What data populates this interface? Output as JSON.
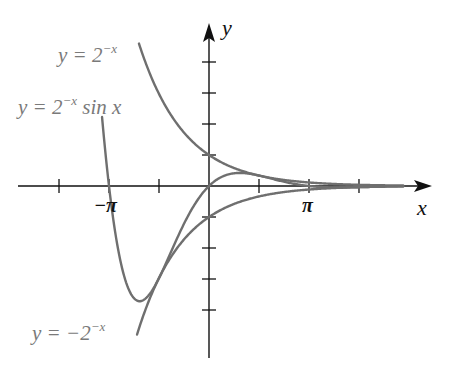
{
  "chart_data": {
    "type": "line",
    "title": "",
    "xlabel": "x",
    "ylabel": "y",
    "x_tick_labels": [
      "-π",
      "π"
    ],
    "x_ticks": [
      -4.712,
      -3.1416,
      -1.5708,
      1.5708,
      3.1416,
      4.712
    ],
    "y_ticks": [
      -4,
      -3,
      -2,
      -1,
      1,
      2,
      3,
      4
    ],
    "xlim": [
      -6.2,
      7.0
    ],
    "ylim": [
      -5.5,
      5.2
    ],
    "grid": false,
    "series": [
      {
        "name": "y = 2^{-x}",
        "label": "y = 2⁻ˣ",
        "expr": "pow(2,-x)",
        "x_range": [
          -2.2,
          6.1
        ]
      },
      {
        "name": "y = 2^{-x} sin x",
        "label": "y = 2⁻ˣ sin x",
        "expr": "pow(2,-x)*sin(x)",
        "x_range": [
          -3.36,
          6.1
        ]
      },
      {
        "name": "y = -2^{-x}",
        "label": "y = −2⁻ˣ",
        "expr": "-pow(2,-x)",
        "x_range": [
          -2.26,
          6.1
        ]
      }
    ],
    "colors": {
      "curve": "#6f6f6f",
      "axis": "#111111",
      "label": "#7a7a7a"
    }
  },
  "labels": {
    "curve1": {
      "prefix": "y = 2",
      "sup": "−x",
      "suffix": ""
    },
    "curve2": {
      "prefix": "y = 2",
      "sup": "−x",
      "suffix": " sin x"
    },
    "curve3": {
      "prefix": "y = −2",
      "sup": "−x",
      "suffix": ""
    },
    "x_axis": "x",
    "y_axis": "y",
    "neg_pi": "−π",
    "pi": "π"
  }
}
